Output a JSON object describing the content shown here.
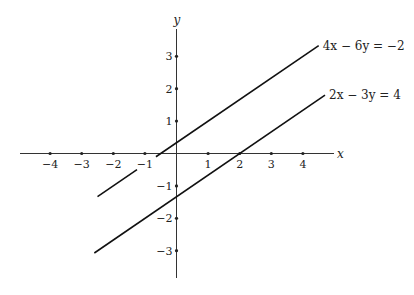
{
  "chart_data": {
    "type": "line",
    "title": "",
    "xlabel": "x",
    "ylabel": "y",
    "xlim": [
      -5.5,
      6.5
    ],
    "ylim": [
      -4.1,
      4.1
    ],
    "grid": false,
    "x_ticks": [
      -4,
      -3,
      -2,
      -1,
      1,
      2,
      3,
      4
    ],
    "y_ticks": [
      -3,
      -2,
      -1,
      1,
      2,
      3
    ],
    "x_tick_labels": [
      "−4",
      "−3",
      "−2",
      "−1",
      "1",
      "2",
      "3",
      "4"
    ],
    "y_tick_labels": [
      "−3",
      "−2",
      "−1",
      "1",
      "2",
      "3"
    ],
    "series": [
      {
        "name": "4x − 6y = −2",
        "label": "4x − 6y = −2",
        "equation": "y = (2x + 1) / 3",
        "segments": [
          {
            "x": [
              -2.5,
              -1.25
            ],
            "y": [
              -1.33,
              -0.5
            ]
          },
          {
            "x": [
              -0.65,
              4.5
            ],
            "y": [
              -0.1,
              3.33
            ]
          }
        ]
      },
      {
        "name": "2x − 3y = 4",
        "label": "2x − 3y = 4",
        "equation": "y = (2x − 4) / 3",
        "segments": [
          {
            "x": [
              -2.6,
              4.7
            ],
            "y": [
              -3.07,
              1.8
            ]
          }
        ]
      }
    ]
  }
}
